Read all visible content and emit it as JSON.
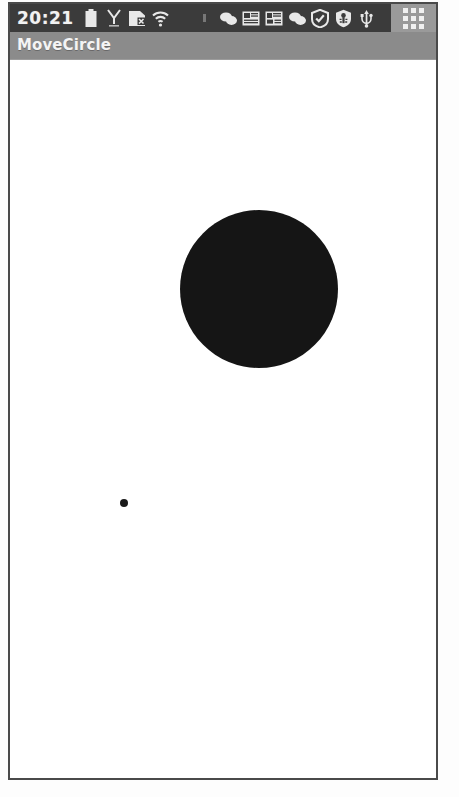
{
  "device": {
    "frame_color": "#4a4a4a",
    "screen_background": "#ffffff"
  },
  "status_bar": {
    "background_color": "#3b3b3b",
    "clock": "20:21",
    "icons": [
      {
        "name": "battery-icon",
        "label": "Battery"
      },
      {
        "name": "signal-antenna-icon",
        "label": "Signal"
      },
      {
        "name": "sd-card-icon",
        "label": "SD card"
      },
      {
        "name": "wifi-icon",
        "label": "Wi-Fi"
      },
      {
        "name": "notification-dot-icon",
        "label": "Notification"
      },
      {
        "name": "chat-bubbles-icon",
        "label": "Messages"
      },
      {
        "name": "news-panel-icon",
        "label": "News"
      },
      {
        "name": "news-panel-alt-icon",
        "label": "Updates"
      },
      {
        "name": "chat-bubbles-alt-icon",
        "label": "Chat"
      },
      {
        "name": "shield-check-icon",
        "label": "Security"
      },
      {
        "name": "usb-debug-icon",
        "label": "USB debugging"
      },
      {
        "name": "usb-icon",
        "label": "USB connected"
      }
    ],
    "app_drawer": {
      "name": "app-drawer-icon",
      "background_color": "#9a9a9a",
      "dot_color": "#f0f0f0",
      "dot_count": 9
    }
  },
  "title_bar": {
    "background_color": "#8b8b8b",
    "title": "MoveCircle",
    "text_color": "#f4f4f4"
  },
  "canvas": {
    "background_color": "#ffffff",
    "shapes": [
      {
        "name": "movable-circle",
        "type": "circle",
        "color": "#151515",
        "center_x": 249,
        "center_y": 228,
        "radius": 79
      },
      {
        "name": "touch-point-dot",
        "type": "circle",
        "color": "#1a1a1a",
        "center_x": 114,
        "center_y": 442,
        "radius": 4
      }
    ]
  }
}
